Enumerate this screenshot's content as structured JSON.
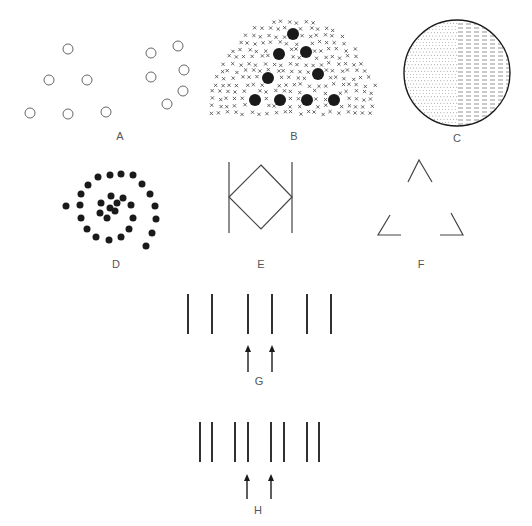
{
  "figure": {
    "panels": [
      {
        "id": "A",
        "label": "A",
        "label_pos": [
          120,
          140
        ],
        "kind": "open-circles",
        "groups": [
          [
            [
              68,
              49
            ],
            [
              49,
              80
            ],
            [
              87,
              80
            ],
            [
              30,
              113
            ],
            [
              68,
              114
            ],
            [
              106,
              112
            ]
          ],
          [
            [
              151,
              53
            ],
            [
              178,
              46
            ],
            [
              151,
              77
            ],
            [
              184,
              70
            ],
            [
              183,
              91
            ],
            [
              167,
              104
            ]
          ]
        ],
        "radius": 5
      },
      {
        "id": "B",
        "label": "B",
        "label_pos": [
          294,
          140
        ],
        "kind": "dots-in-crosses",
        "big_dots": [
          [
            293,
            34
          ],
          [
            279,
            54
          ],
          [
            306,
            52
          ],
          [
            268,
            78
          ],
          [
            318,
            74
          ],
          [
            255,
            100
          ],
          [
            280,
            100
          ],
          [
            307,
            100
          ],
          [
            334,
            100
          ]
        ],
        "dot_radius": 6
      },
      {
        "id": "C",
        "label": "C",
        "label_pos": [
          457,
          142
        ],
        "kind": "textured-circle",
        "center": [
          457,
          73
        ],
        "radius": 53,
        "left_texture": "dots",
        "right_texture": "dashes"
      },
      {
        "id": "D",
        "label": "D",
        "label_pos": [
          116,
          268
        ],
        "kind": "spiral-dots",
        "dots": [
          [
            66,
            206
          ],
          [
            80,
            205
          ],
          [
            81,
            194
          ],
          [
            88,
            185
          ],
          [
            98,
            177
          ],
          [
            110,
            175
          ],
          [
            121,
            174
          ],
          [
            133,
            175
          ],
          [
            142,
            184
          ],
          [
            150,
            194
          ],
          [
            155,
            206
          ],
          [
            156,
            219
          ],
          [
            152,
            233
          ],
          [
            146,
            246
          ],
          [
            81,
            218
          ],
          [
            87,
            229
          ],
          [
            96,
            237
          ],
          [
            109,
            240
          ],
          [
            121,
            237
          ],
          [
            129,
            229
          ],
          [
            133,
            218
          ],
          [
            131,
            205
          ],
          [
            123,
            198
          ],
          [
            111,
            196
          ],
          [
            101,
            203
          ],
          [
            100,
            213
          ],
          [
            107,
            218
          ],
          [
            115,
            211
          ],
          [
            110,
            208
          ],
          [
            117,
            203
          ]
        ],
        "dot_radius": 3.5
      },
      {
        "id": "E",
        "label": "E",
        "label_pos": [
          261,
          268
        ],
        "kind": "diamond-between-lines",
        "left_line": [
          [
            229,
            162
          ],
          [
            229,
            233
          ]
        ],
        "right_line": [
          [
            292,
            162
          ],
          [
            292,
            233
          ]
        ],
        "diamond": [
          [
            261,
            165
          ],
          [
            292,
            197
          ],
          [
            261,
            229
          ],
          [
            229,
            197
          ]
        ]
      },
      {
        "id": "F",
        "label": "F",
        "label_pos": [
          421,
          268
        ],
        "kind": "illusory-triangle-corners",
        "corners": [
          [
            [
              408,
              182
            ],
            [
              419,
              160
            ],
            [
              432,
              182
            ]
          ],
          [
            [
              390,
              215
            ],
            [
              378,
              235
            ],
            [
              401,
              235
            ]
          ],
          [
            [
              451,
              213
            ],
            [
              463,
              235
            ],
            [
              440,
              235
            ]
          ]
        ]
      },
      {
        "id": "G",
        "label": "G",
        "label_pos": [
          259,
          385
        ],
        "kind": "paired-lines-with-arrows",
        "lines_x": [
          188,
          212,
          248,
          272,
          307,
          331
        ],
        "y_top": 294,
        "y_bottom": 334,
        "arrows_x": [
          248,
          272
        ],
        "arrow_y_top": 345,
        "arrow_y_bottom": 372
      },
      {
        "id": "H",
        "label": "H",
        "label_pos": [
          258,
          514
        ],
        "kind": "paired-lines-with-arrows",
        "lines_x": [
          200,
          212,
          235,
          248,
          271,
          284,
          307,
          319
        ],
        "y_top": 422,
        "y_bottom": 462,
        "arrows_x": [
          247,
          271
        ],
        "arrow_y_top": 474,
        "arrow_y_bottom": 499
      }
    ],
    "colors": {
      "stroke": "#1a1a1a",
      "circle_stroke": "#666666",
      "label": "#555555",
      "background": "#ffffff"
    }
  }
}
